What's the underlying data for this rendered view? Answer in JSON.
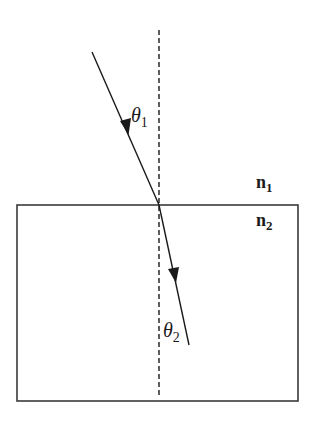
{
  "diagram": {
    "type": "refraction",
    "labels": {
      "theta1_symbol": "θ",
      "theta1_sub": "1",
      "theta2_symbol": "θ",
      "theta2_sub": "2",
      "n1_symbol": "n",
      "n1_sub": "1",
      "n2_symbol": "n",
      "n2_sub": "2"
    },
    "elements": {
      "normal_line": "dashed vertical normal",
      "incident_ray": "incident ray with arrow",
      "refracted_ray": "refracted ray with arrow",
      "medium_box": "medium n2 boundary"
    },
    "colors": {
      "line": "#1a1a1a",
      "box": "#3a3a3a",
      "background": "#ffffff"
    }
  }
}
